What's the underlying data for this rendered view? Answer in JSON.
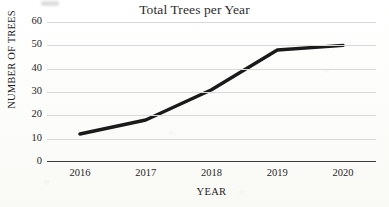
{
  "chart_data": {
    "type": "line",
    "title": "Total Trees per Year",
    "xlabel": "YEAR",
    "ylabel": "NUMBER OF TREES",
    "categories": [
      "2016",
      "2017",
      "2018",
      "2019",
      "2020"
    ],
    "values": [
      12,
      18,
      31,
      48,
      50
    ],
    "series": [
      {
        "name": "Total Trees",
        "values": [
          12,
          18,
          31,
          48,
          50
        ]
      }
    ],
    "ylim": [
      0,
      60
    ],
    "yticks": [
      0,
      10,
      20,
      30,
      40,
      50,
      60
    ],
    "ytick_labels": [
      "0",
      "10",
      "20",
      "30",
      "40",
      "50",
      "60"
    ],
    "grid": true,
    "grid_axis": "y",
    "legend": false,
    "legend_position": "none",
    "markers": false,
    "line_color": "#1a1a1a",
    "line_width": 3,
    "grid_color": "#d9d9d9",
    "axis_color": "#3a3a3a",
    "background_color": "#fdfdfb"
  }
}
